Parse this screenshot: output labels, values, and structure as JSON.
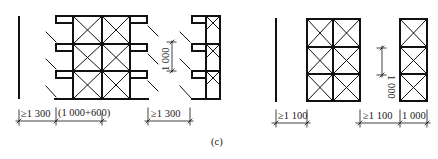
{
  "figure": {
    "caption": "(c)",
    "left_diagram": {
      "dims": {
        "gap_wall": "≥1 300",
        "bay": "(1 000+600)",
        "gap_between": "≥1 300",
        "height": "1 000"
      }
    },
    "right_diagram": {
      "dims": {
        "gap_wall": "≥1 100",
        "gap_between": "≥1 100",
        "width": "1 000",
        "height": "1 000"
      }
    }
  }
}
